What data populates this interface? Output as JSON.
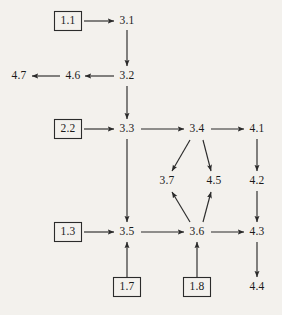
{
  "diagram": {
    "background_color": "#f3f1ed",
    "line_color": "#2b2b2b",
    "text_color": "#1a1a1a",
    "nodes": [
      {
        "id": "n1_1",
        "label": "1.1",
        "x": 68,
        "y": 21,
        "shape": "box"
      },
      {
        "id": "n3_1",
        "label": "3.1",
        "x": 127,
        "y": 21,
        "shape": "plain"
      },
      {
        "id": "n3_2",
        "label": "3.2",
        "x": 127,
        "y": 76,
        "shape": "plain"
      },
      {
        "id": "n4_6",
        "label": "4.6",
        "x": 73,
        "y": 76,
        "shape": "plain"
      },
      {
        "id": "n4_7",
        "label": "4.7",
        "x": 19,
        "y": 76,
        "shape": "plain"
      },
      {
        "id": "n2_2",
        "label": "2.2",
        "x": 68,
        "y": 129,
        "shape": "box"
      },
      {
        "id": "n3_3",
        "label": "3.3",
        "x": 127,
        "y": 129,
        "shape": "plain"
      },
      {
        "id": "n3_4",
        "label": "3.4",
        "x": 197,
        "y": 129,
        "shape": "plain"
      },
      {
        "id": "n4_1",
        "label": "4.1",
        "x": 257,
        "y": 129,
        "shape": "plain"
      },
      {
        "id": "n3_7",
        "label": "3.7",
        "x": 167,
        "y": 181,
        "shape": "plain"
      },
      {
        "id": "n4_5",
        "label": "4.5",
        "x": 214,
        "y": 181,
        "shape": "plain"
      },
      {
        "id": "n4_2",
        "label": "4.2",
        "x": 257,
        "y": 181,
        "shape": "plain"
      },
      {
        "id": "n1_3",
        "label": "1.3",
        "x": 68,
        "y": 232,
        "shape": "box"
      },
      {
        "id": "n3_5",
        "label": "3.5",
        "x": 127,
        "y": 232,
        "shape": "plain"
      },
      {
        "id": "n3_6",
        "label": "3.6",
        "x": 197,
        "y": 232,
        "shape": "plain"
      },
      {
        "id": "n4_3",
        "label": "4.3",
        "x": 257,
        "y": 232,
        "shape": "plain"
      },
      {
        "id": "n1_7",
        "label": "1.7",
        "x": 127,
        "y": 287,
        "shape": "box"
      },
      {
        "id": "n1_8",
        "label": "1.8",
        "x": 197,
        "y": 287,
        "shape": "box"
      },
      {
        "id": "n4_4",
        "label": "4.4",
        "x": 257,
        "y": 287,
        "shape": "plain"
      }
    ],
    "edges": [
      {
        "from": "1.1",
        "to": "3.1",
        "x1": 84,
        "y1": 21,
        "x2": 114,
        "y2": 21
      },
      {
        "from": "3.1",
        "to": "3.2",
        "x1": 127,
        "y1": 30,
        "x2": 127,
        "y2": 66
      },
      {
        "from": "3.2",
        "to": "4.6",
        "x1": 114,
        "y1": 76,
        "x2": 85,
        "y2": 76
      },
      {
        "from": "4.6",
        "to": "4.7",
        "x1": 60,
        "y1": 76,
        "x2": 32,
        "y2": 76
      },
      {
        "from": "3.2",
        "to": "3.3",
        "x1": 127,
        "y1": 86,
        "x2": 127,
        "y2": 119
      },
      {
        "from": "2.2",
        "to": "3.3",
        "x1": 84,
        "y1": 129,
        "x2": 114,
        "y2": 129
      },
      {
        "from": "3.3",
        "to": "3.4",
        "x1": 141,
        "y1": 129,
        "x2": 184,
        "y2": 129
      },
      {
        "from": "3.4",
        "to": "4.1",
        "x1": 211,
        "y1": 129,
        "x2": 244,
        "y2": 129
      },
      {
        "from": "3.3",
        "to": "3.5",
        "x1": 127,
        "y1": 139,
        "x2": 127,
        "y2": 222
      },
      {
        "from": "3.4",
        "to": "3.7",
        "x1": 190,
        "y1": 140,
        "x2": 172,
        "y2": 171
      },
      {
        "from": "3.4",
        "to": "4.5",
        "x1": 203,
        "y1": 140,
        "x2": 211,
        "y2": 171
      },
      {
        "from": "4.1",
        "to": "4.2",
        "x1": 257,
        "y1": 139,
        "x2": 257,
        "y2": 171
      },
      {
        "from": "3.6",
        "to": "3.7",
        "x1": 190,
        "y1": 222,
        "x2": 172,
        "y2": 192
      },
      {
        "from": "3.6",
        "to": "4.5",
        "x1": 203,
        "y1": 222,
        "x2": 211,
        "y2": 192
      },
      {
        "from": "4.2",
        "to": "4.3",
        "x1": 257,
        "y1": 191,
        "x2": 257,
        "y2": 222
      },
      {
        "from": "1.3",
        "to": "3.5",
        "x1": 84,
        "y1": 232,
        "x2": 114,
        "y2": 232
      },
      {
        "from": "3.5",
        "to": "3.6",
        "x1": 141,
        "y1": 232,
        "x2": 184,
        "y2": 232
      },
      {
        "from": "3.6",
        "to": "4.3",
        "x1": 211,
        "y1": 232,
        "x2": 244,
        "y2": 232
      },
      {
        "from": "1.7",
        "to": "3.5",
        "x1": 127,
        "y1": 277,
        "x2": 127,
        "y2": 242
      },
      {
        "from": "1.8",
        "to": "3.6",
        "x1": 197,
        "y1": 277,
        "x2": 197,
        "y2": 242
      },
      {
        "from": "4.3",
        "to": "4.4",
        "x1": 257,
        "y1": 242,
        "x2": 257,
        "y2": 277
      }
    ]
  }
}
